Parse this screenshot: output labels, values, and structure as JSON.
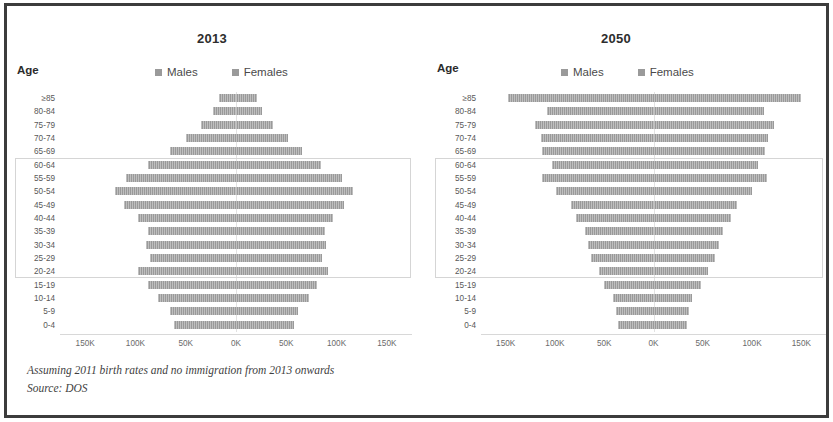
{
  "footnotes": {
    "assumption": "Assuming 2011 birth rates and no immigration from 2013 onwards",
    "source": "Source: DOS"
  },
  "legend": {
    "males_label": "Males",
    "females_label": "Females"
  },
  "axis": {
    "age_label": "Age",
    "ticks": [
      "150K",
      "100K",
      "50K",
      "0K",
      "50K",
      "100K",
      "150K"
    ],
    "tick_values": [
      -150000,
      -100000,
      -50000,
      0,
      50000,
      100000,
      150000
    ]
  },
  "colors": {
    "bar": "#a3a3a3",
    "frame": "#3c3c3c",
    "gridline": "#e2e2e2",
    "highlight_border": "#d5d5d5"
  },
  "chart_data": [
    {
      "type": "bar",
      "title": "2013",
      "xlabel": "",
      "ylabel": "Age",
      "xlim": [
        -175000,
        175000
      ],
      "grid": false,
      "legend_position": "top",
      "orientation": "population-pyramid",
      "categories": [
        "≥85",
        "80-84",
        "75-79",
        "70-74",
        "65-69",
        "60-64",
        "55-59",
        "50-54",
        "45-49",
        "40-44",
        "35-39",
        "30-34",
        "25-29",
        "20-24",
        "15-19",
        "10-14",
        "5-9",
        "0-4"
      ],
      "series": [
        {
          "name": "Males",
          "values": [
            17000,
            23000,
            35000,
            50000,
            66000,
            88000,
            109000,
            120000,
            111000,
            97000,
            88000,
            90000,
            86000,
            97000,
            88000,
            78000,
            66000,
            62000
          ]
        },
        {
          "name": "Females",
          "values": [
            21000,
            26000,
            37000,
            52000,
            66000,
            85000,
            105000,
            116000,
            107000,
            96000,
            88000,
            89000,
            86000,
            91000,
            81000,
            73000,
            62000,
            58000
          ]
        }
      ]
    },
    {
      "type": "bar",
      "title": "2050",
      "xlabel": "",
      "ylabel": "Age",
      "xlim": [
        -175000,
        175000
      ],
      "grid": false,
      "legend_position": "top",
      "orientation": "population-pyramid",
      "categories": [
        "≥85",
        "80-84",
        "75-79",
        "70-74",
        "65-69",
        "60-64",
        "55-59",
        "50-54",
        "45-49",
        "40-44",
        "35-39",
        "30-34",
        "25-29",
        "20-24",
        "15-19",
        "10-14",
        "5-9",
        "0-4"
      ],
      "series": [
        {
          "name": "Males",
          "values": [
            148000,
            108000,
            120000,
            114000,
            113000,
            103000,
            113000,
            99000,
            84000,
            79000,
            70000,
            66000,
            63000,
            55000,
            50000,
            41000,
            38000,
            36000
          ]
        },
        {
          "name": "Females",
          "values": [
            150000,
            112000,
            122000,
            116000,
            113000,
            106000,
            115000,
            100000,
            85000,
            79000,
            71000,
            66000,
            62000,
            55000,
            48000,
            39000,
            36000,
            34000
          ]
        }
      ]
    }
  ]
}
